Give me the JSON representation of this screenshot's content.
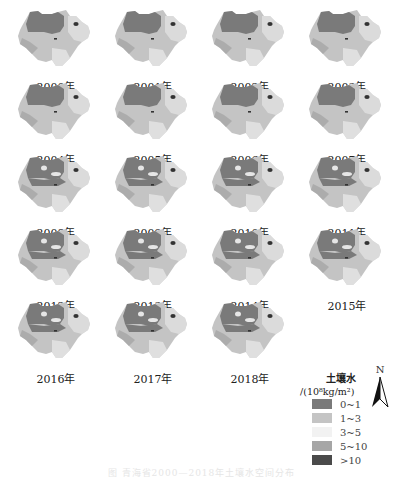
{
  "figure": {
    "caption": "图 青海省2000—2018年土壤水空间分布",
    "panels": [
      {
        "year": "2000年",
        "variant": 0
      },
      {
        "year": "2001年",
        "variant": 0
      },
      {
        "year": "2002年",
        "variant": 0
      },
      {
        "year": "2003年",
        "variant": 1
      },
      {
        "year": "2004年",
        "variant": 0
      },
      {
        "year": "2005年",
        "variant": 0
      },
      {
        "year": "2006年",
        "variant": 0
      },
      {
        "year": "2007年",
        "variant": 1
      },
      {
        "year": "2008年",
        "variant": 2
      },
      {
        "year": "2009年",
        "variant": 2
      },
      {
        "year": "2010年",
        "variant": 2
      },
      {
        "year": "2011年",
        "variant": 2
      },
      {
        "year": "2012年",
        "variant": 2
      },
      {
        "year": "2013年",
        "variant": 2
      },
      {
        "year": "2014年",
        "variant": 2
      },
      {
        "year": "2015年",
        "variant": 2
      },
      {
        "year": "2016年",
        "variant": 2
      },
      {
        "year": "2017年",
        "variant": 2
      },
      {
        "year": "2018年",
        "variant": 2
      }
    ]
  },
  "legend": {
    "title": "土壤水",
    "unit": "/(10⁸kg/m²)",
    "classes": [
      {
        "label": "0~1",
        "color": "#7a7a7a"
      },
      {
        "label": "1~3",
        "color": "#c4c4c4"
      },
      {
        "label": "3~5",
        "color": "#f2f2f2"
      },
      {
        "label": "5~10",
        "color": "#a6a6a6"
      },
      {
        "label": ">10",
        "color": "#4a4a4a"
      }
    ]
  },
  "north_arrow": {
    "label": "N"
  },
  "colors": {
    "dry": "#7a7a7a",
    "light": "#c4c4c4",
    "pale": "#e6e6e6",
    "mid": "#a6a6a6",
    "lake": "#333333"
  }
}
